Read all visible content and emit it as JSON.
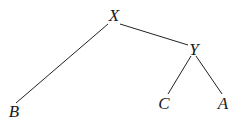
{
  "tree": {
    "nodes": [
      {
        "id": "X",
        "label": "X",
        "x": 114,
        "y": 15
      },
      {
        "id": "Y",
        "label": "Y",
        "x": 194,
        "y": 49
      },
      {
        "id": "B",
        "label": "B",
        "x": 14,
        "y": 111
      },
      {
        "id": "C",
        "label": "C",
        "x": 164,
        "y": 103
      },
      {
        "id": "A",
        "label": "A",
        "x": 223,
        "y": 103
      }
    ],
    "edges": [
      {
        "from": "X",
        "to": "B"
      },
      {
        "from": "X",
        "to": "Y"
      },
      {
        "from": "Y",
        "to": "C"
      },
      {
        "from": "Y",
        "to": "A"
      }
    ],
    "line_color": "#222222"
  }
}
